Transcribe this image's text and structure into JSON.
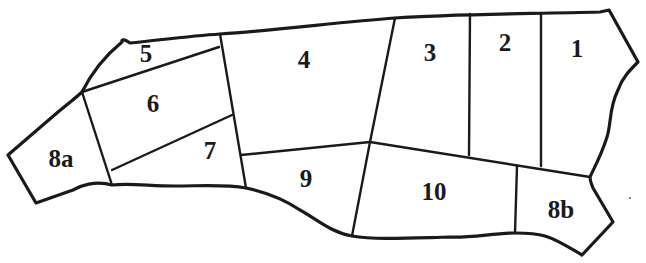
{
  "diagram": {
    "colors": {
      "stroke": "#1a1a1a",
      "background": "#ffffff"
    },
    "regions": [
      {
        "id": "1",
        "label": "1",
        "x": 577,
        "y": 51
      },
      {
        "id": "2",
        "label": "2",
        "x": 505,
        "y": 45
      },
      {
        "id": "3",
        "label": "3",
        "x": 430,
        "y": 55
      },
      {
        "id": "4",
        "label": "4",
        "x": 304,
        "y": 62
      },
      {
        "id": "5",
        "label": "5",
        "x": 146,
        "y": 56
      },
      {
        "id": "6",
        "label": "6",
        "x": 153,
        "y": 106
      },
      {
        "id": "7",
        "label": "7",
        "x": 210,
        "y": 153
      },
      {
        "id": "8a",
        "label": "8a",
        "x": 61,
        "y": 161
      },
      {
        "id": "8b",
        "label": "8b",
        "x": 561,
        "y": 212
      },
      {
        "id": "9",
        "label": "9",
        "x": 306,
        "y": 181
      },
      {
        "id": "10",
        "label": "10",
        "x": 434,
        "y": 194
      }
    ]
  }
}
